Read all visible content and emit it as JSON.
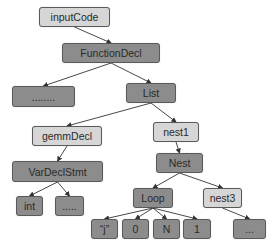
{
  "colors": {
    "light": "#d6d6d6",
    "dark": "#8c8c8c",
    "border": "#5a5a5a",
    "edge": "#333333"
  },
  "nodes": [
    {
      "id": "inputCode",
      "label": "inputCode",
      "style": "light",
      "x": 39,
      "y": 7,
      "w": 71,
      "h": 20
    },
    {
      "id": "functionDecl",
      "label": "FunctionDecl",
      "style": "dark",
      "x": 62,
      "y": 43,
      "w": 98,
      "h": 20
    },
    {
      "id": "ellipsis1",
      "label": "........",
      "style": "dark",
      "x": 12,
      "y": 86,
      "w": 63,
      "h": 21
    },
    {
      "id": "list",
      "label": "List",
      "style": "dark",
      "x": 126,
      "y": 83,
      "w": 50,
      "h": 20
    },
    {
      "id": "gemmDecl",
      "label": "gemmDecl",
      "style": "light",
      "x": 32,
      "y": 126,
      "w": 70,
      "h": 20
    },
    {
      "id": "nest1",
      "label": "nest1",
      "style": "light",
      "x": 153,
      "y": 122,
      "w": 46,
      "h": 20
    },
    {
      "id": "varDeclStmt",
      "label": "VarDeclStmt",
      "style": "dark",
      "x": 12,
      "y": 161,
      "w": 91,
      "h": 21
    },
    {
      "id": "nest",
      "label": "Nest",
      "style": "dark",
      "x": 156,
      "y": 153,
      "w": 47,
      "h": 20
    },
    {
      "id": "int",
      "label": "int",
      "style": "dark",
      "x": 16,
      "y": 196,
      "w": 27,
      "h": 20
    },
    {
      "id": "ellipsis2",
      "label": ".....",
      "style": "dark",
      "x": 55,
      "y": 196,
      "w": 29,
      "h": 20
    },
    {
      "id": "loop",
      "label": "Loop",
      "style": "dark",
      "x": 133,
      "y": 188,
      "w": 40,
      "h": 20
    },
    {
      "id": "nest3",
      "label": "nest3",
      "style": "light",
      "x": 203,
      "y": 188,
      "w": 39,
      "h": 20
    },
    {
      "id": "j",
      "label": "“j”",
      "style": "dark",
      "x": 91,
      "y": 219,
      "w": 27,
      "h": 20
    },
    {
      "id": "zero",
      "label": "0",
      "style": "dark",
      "x": 122,
      "y": 219,
      "w": 27,
      "h": 20
    },
    {
      "id": "n",
      "label": "N",
      "style": "dark",
      "x": 153,
      "y": 219,
      "w": 27,
      "h": 20
    },
    {
      "id": "one",
      "label": "1",
      "style": "dark",
      "x": 183,
      "y": 219,
      "w": 28,
      "h": 20
    },
    {
      "id": "ellipsis3",
      "label": "...",
      "style": "dark",
      "x": 233,
      "y": 219,
      "w": 33,
      "h": 20
    }
  ],
  "edges": [
    [
      "inputCode",
      "functionDecl"
    ],
    [
      "functionDecl",
      "ellipsis1"
    ],
    [
      "functionDecl",
      "list"
    ],
    [
      "list",
      "gemmDecl"
    ],
    [
      "list",
      "nest1"
    ],
    [
      "gemmDecl",
      "varDeclStmt"
    ],
    [
      "nest1",
      "nest"
    ],
    [
      "varDeclStmt",
      "int"
    ],
    [
      "varDeclStmt",
      "ellipsis2"
    ],
    [
      "nest",
      "loop"
    ],
    [
      "nest",
      "nest3"
    ],
    [
      "loop",
      "j"
    ],
    [
      "loop",
      "zero"
    ],
    [
      "loop",
      "n"
    ],
    [
      "loop",
      "one"
    ],
    [
      "nest3",
      "ellipsis3"
    ]
  ]
}
